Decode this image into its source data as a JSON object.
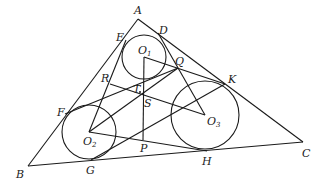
{
  "diagram": {
    "type": "geometry",
    "points": {
      "A": {
        "label": "A",
        "x": 138,
        "y": 19,
        "lx": 134,
        "ly": 14
      },
      "B": {
        "label": "B",
        "x": 28,
        "y": 166,
        "lx": 16,
        "ly": 178
      },
      "C": {
        "label": "C",
        "x": 303,
        "y": 142,
        "lx": 302,
        "ly": 157
      },
      "D": {
        "label": "D",
        "x": 158,
        "y": 33,
        "lx": 159,
        "ly": 34
      },
      "E": {
        "label": "E",
        "x": 126,
        "y": 40,
        "lx": 116,
        "ly": 41
      },
      "F": {
        "label": "F",
        "x": 65,
        "y": 114,
        "lx": 57,
        "ly": 116
      },
      "G": {
        "label": "G",
        "x": 91,
        "y": 160,
        "lx": 86,
        "ly": 174
      },
      "H": {
        "label": "H",
        "x": 207,
        "y": 151,
        "lx": 202,
        "ly": 165
      },
      "K": {
        "label": "K",
        "x": 225,
        "y": 84,
        "lx": 228,
        "ly": 83
      },
      "Q": {
        "label": "Q",
        "x": 178,
        "y": 68,
        "lx": 175,
        "ly": 65
      },
      "R": {
        "label": "R",
        "x": 110,
        "y": 84,
        "lx": 101,
        "ly": 82
      },
      "T": {
        "label": "T",
        "x": 140,
        "y": 92,
        "lx": 133,
        "ly": 93
      },
      "S": {
        "label": "S",
        "x": 143,
        "y": 95,
        "lx": 144,
        "ly": 107
      },
      "P": {
        "label": "P",
        "x": 143,
        "y": 140,
        "lx": 140,
        "ly": 152
      },
      "O1": {
        "label": "O",
        "sub": "1",
        "x": 144,
        "y": 57,
        "lx": 138,
        "ly": 54
      },
      "O2": {
        "label": "O",
        "sub": "2",
        "x": 89,
        "y": 132,
        "lx": 83,
        "ly": 145
      },
      "O3": {
        "label": "O",
        "sub": "3",
        "x": 205,
        "y": 115,
        "lx": 207,
        "ly": 125
      }
    },
    "circles": [
      {
        "name": "circle-o1",
        "cx": 144,
        "cy": 57,
        "r": 22
      },
      {
        "name": "circle-o2",
        "cx": 89,
        "cy": 132,
        "r": 27
      },
      {
        "name": "circle-o3",
        "cx": 205,
        "cy": 115,
        "r": 34
      }
    ],
    "segments": [
      [
        "A",
        "B"
      ],
      [
        "B",
        "C"
      ],
      [
        "C",
        "A"
      ],
      [
        "F",
        "Q"
      ],
      [
        "E",
        "O2"
      ],
      [
        "D",
        "O3"
      ],
      [
        "O1",
        "K"
      ],
      [
        "O1",
        "P"
      ],
      [
        "R",
        "O3"
      ],
      [
        "O2",
        "Q"
      ],
      [
        "O2",
        "H"
      ],
      [
        "G",
        "K"
      ]
    ]
  }
}
